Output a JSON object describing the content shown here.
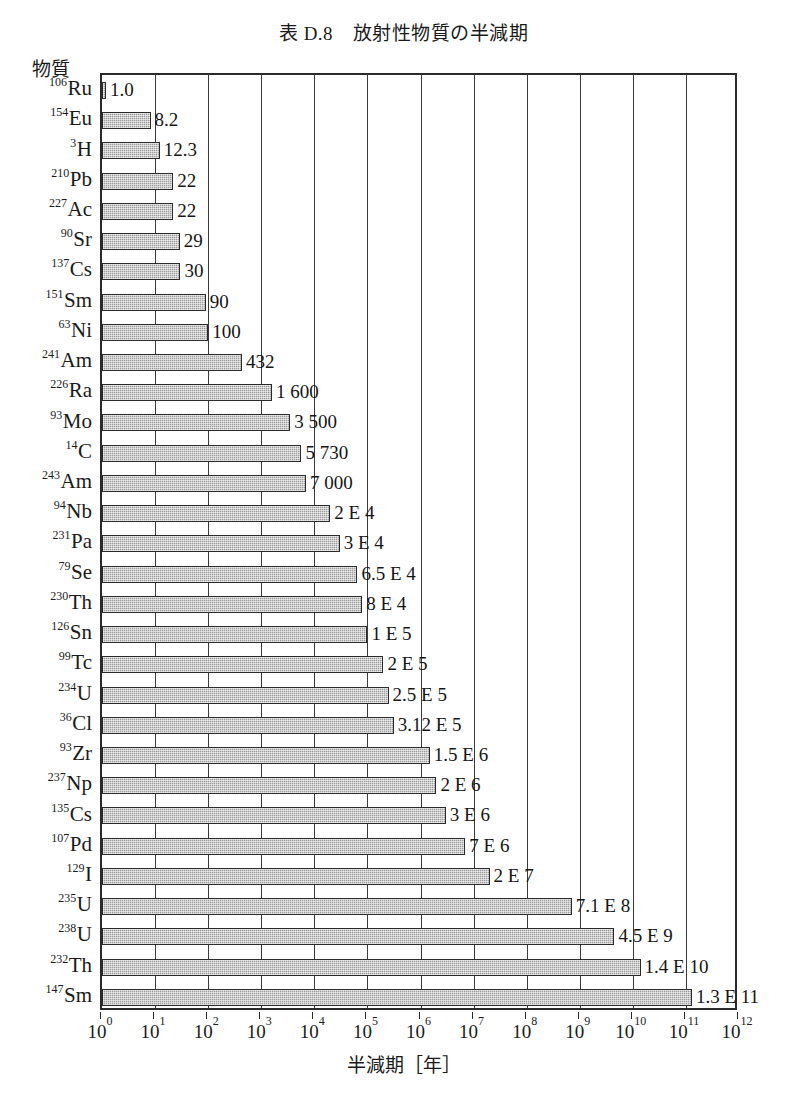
{
  "chart_data": {
    "type": "bar",
    "orientation": "horizontal",
    "title": "表 D.8　放射性物質の半減期",
    "xlabel": "半減期［年］",
    "ylabel": "物質",
    "xscale": "log",
    "xlim": [
      1,
      1000000000000
    ],
    "grid": true,
    "legend": null,
    "xtick_labels": [
      "10⁰",
      "10¹",
      "10²",
      "10³",
      "10⁴",
      "10⁵",
      "10⁶",
      "10⁷",
      "10⁸",
      "10⁹",
      "10¹⁰",
      "10¹¹",
      "10¹²"
    ],
    "xtick_bases": [
      "10",
      "10",
      "10",
      "10",
      "10",
      "10",
      "10",
      "10",
      "10",
      "10",
      "10",
      "10",
      "10"
    ],
    "xtick_exponents": [
      "0",
      "1",
      "2",
      "3",
      "4",
      "5",
      "6",
      "7",
      "8",
      "9",
      "10",
      "11",
      "12"
    ],
    "categories": [
      "106Ru",
      "154Eu",
      "3H",
      "210Pb",
      "227Ac",
      "90Sr",
      "137Cs",
      "151Sm",
      "63Ni",
      "241Am",
      "226Ra",
      "93Mo",
      "14C",
      "243Am",
      "94Nb",
      "231Pa",
      "79Se",
      "230Th",
      "126Sn",
      "99Tc",
      "234U",
      "36Cl",
      "93Zr",
      "237Np",
      "135Cs",
      "107Pd",
      "129I",
      "235U",
      "238U",
      "232Th",
      "147Sm"
    ],
    "values": [
      1.0,
      8.2,
      12.3,
      22,
      22,
      29,
      30,
      90,
      100,
      432,
      1600,
      3500,
      5730,
      7000,
      20000,
      30000,
      65000,
      80000,
      100000,
      200000,
      250000,
      312000,
      1500000,
      2000000,
      3000000,
      7000000,
      20000000,
      710000000,
      4500000000,
      14000000000,
      130000000000
    ],
    "bars": [
      {
        "mass": "106",
        "symbol": "Ru",
        "value": 1.0,
        "label": "1.0"
      },
      {
        "mass": "154",
        "symbol": "Eu",
        "value": 8.2,
        "label": "8.2"
      },
      {
        "mass": "3",
        "symbol": "H",
        "value": 12.3,
        "label": "12.3"
      },
      {
        "mass": "210",
        "symbol": "Pb",
        "value": 22,
        "label": "22"
      },
      {
        "mass": "227",
        "symbol": "Ac",
        "value": 22,
        "label": "22"
      },
      {
        "mass": "90",
        "symbol": "Sr",
        "value": 29,
        "label": "29"
      },
      {
        "mass": "137",
        "symbol": "Cs",
        "value": 30,
        "label": "30"
      },
      {
        "mass": "151",
        "symbol": "Sm",
        "value": 90,
        "label": "90"
      },
      {
        "mass": "63",
        "symbol": "Ni",
        "value": 100,
        "label": "100"
      },
      {
        "mass": "241",
        "symbol": "Am",
        "value": 432,
        "label": "432"
      },
      {
        "mass": "226",
        "symbol": "Ra",
        "value": 1600,
        "label": "1 600"
      },
      {
        "mass": "93",
        "symbol": "Mo",
        "value": 3500,
        "label": "3 500"
      },
      {
        "mass": "14",
        "symbol": "C",
        "value": 5730,
        "label": "5 730"
      },
      {
        "mass": "243",
        "symbol": "Am",
        "value": 7000,
        "label": "7 000"
      },
      {
        "mass": "94",
        "symbol": "Nb",
        "value": 20000,
        "label": "2 E 4"
      },
      {
        "mass": "231",
        "symbol": "Pa",
        "value": 30000,
        "label": "3 E 4"
      },
      {
        "mass": "79",
        "symbol": "Se",
        "value": 65000,
        "label": "6.5 E 4"
      },
      {
        "mass": "230",
        "symbol": "Th",
        "value": 80000,
        "label": "8 E 4"
      },
      {
        "mass": "126",
        "symbol": "Sn",
        "value": 100000,
        "label": "1 E 5"
      },
      {
        "mass": "99",
        "symbol": "Tc",
        "value": 200000,
        "label": "2 E 5"
      },
      {
        "mass": "234",
        "symbol": "U",
        "value": 250000,
        "label": "2.5 E 5"
      },
      {
        "mass": "36",
        "symbol": "Cl",
        "value": 312000,
        "label": "3.12 E 5"
      },
      {
        "mass": "93",
        "symbol": "Zr",
        "value": 1500000,
        "label": "1.5 E 6"
      },
      {
        "mass": "237",
        "symbol": "Np",
        "value": 2000000,
        "label": "2 E 6"
      },
      {
        "mass": "135",
        "symbol": "Cs",
        "value": 3000000,
        "label": "3 E 6"
      },
      {
        "mass": "107",
        "symbol": "Pd",
        "value": 7000000,
        "label": "7 E 6"
      },
      {
        "mass": "129",
        "symbol": "I",
        "value": 20000000,
        "label": "2 E 7"
      },
      {
        "mass": "235",
        "symbol": "U",
        "value": 710000000,
        "label": "7.1 E 8"
      },
      {
        "mass": "238",
        "symbol": "U",
        "value": 4500000000,
        "label": "4.5 E 9"
      },
      {
        "mass": "232",
        "symbol": "Th",
        "value": 14000000000,
        "label": "1.4 E 10"
      },
      {
        "mass": "147",
        "symbol": "Sm",
        "value": 130000000000,
        "label": "1.3 E 11"
      }
    ],
    "colors": {
      "bar_fill": "#9c9c9c",
      "bar_border": "#2b2b2b",
      "axis": "#2a2a2a",
      "grid": "#3a3a3a",
      "text": "#1a1a1a",
      "background": "#ffffff"
    }
  }
}
